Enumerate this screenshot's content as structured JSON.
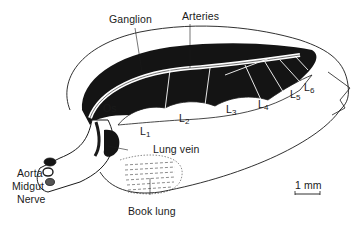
{
  "figure": {
    "labels": {
      "ganglion": "Ganglion",
      "arteries": "Arteries",
      "os": "Os",
      "lung_vein": "Lung vein",
      "aorta": "Aorta",
      "midgut": "Midgut",
      "nerve": "Nerve",
      "book_lung": "Book lung",
      "scale": "1 mm"
    },
    "segments": [
      {
        "base": "L",
        "sub": "1"
      },
      {
        "base": "L",
        "sub": "2"
      },
      {
        "base": "L",
        "sub": "3"
      },
      {
        "base": "L",
        "sub": "4"
      },
      {
        "base": "L",
        "sub": "5"
      },
      {
        "base": "L",
        "sub": "6"
      }
    ],
    "colors": {
      "ink": "#1a1a1a",
      "background": "#ffffff"
    }
  }
}
